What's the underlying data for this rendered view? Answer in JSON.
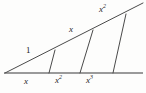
{
  "figure": {
    "colors": {
      "stroke": "#4a4a4a",
      "baseline": "#9a9a9a",
      "text": "#262626",
      "background": "#fdfdfc"
    },
    "geometry": {
      "vertex": {
        "x": 5,
        "y": 73
      },
      "baseline": {
        "x1": 4,
        "y1": 73,
        "x2": 143,
        "y2": 73,
        "width": 2.2
      },
      "hypotenuse": {
        "x1": 5,
        "y1": 73,
        "x2": 143,
        "y2": 3,
        "width": 1
      },
      "transversals": [
        {
          "name": "transversal-1",
          "x1": 49,
          "y1": 73,
          "x2": 55,
          "y2": 50,
          "width": 1
        },
        {
          "name": "transversal-2",
          "x1": 80,
          "y1": 73,
          "x2": 93,
          "y2": 30,
          "width": 1
        },
        {
          "name": "transversal-3",
          "x1": 113,
          "y1": 73,
          "x2": 126,
          "y2": 14,
          "width": 1
        }
      ]
    },
    "labels": {
      "hypotenuse_segment_1": "1",
      "hypotenuse_segment_2": "x",
      "hypotenuse_segment_3_base": "x",
      "hypotenuse_segment_3_exp": "2",
      "base_segment_1": "x",
      "base_segment_2_base": "x",
      "base_segment_2_exp": "2",
      "base_segment_3_base": "x",
      "base_segment_3_exp": "3"
    }
  }
}
